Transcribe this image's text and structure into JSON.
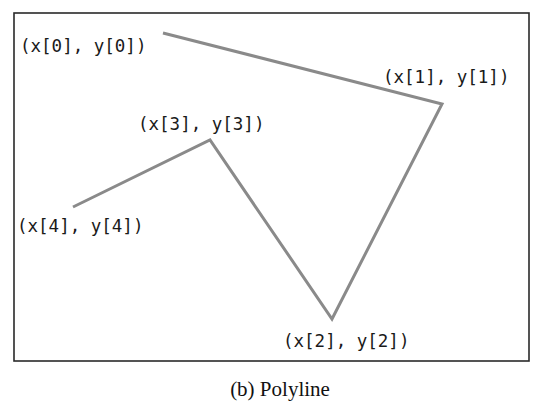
{
  "figure": {
    "caption": "(b) Polyline",
    "frame": {
      "x": 14,
      "y": 13,
      "width": 515,
      "height": 348,
      "stroke": "#2a2a2a"
    },
    "line_color": "#8a8a8a"
  },
  "vertices": [
    {
      "label": "(x[0], y[0])",
      "x": 163,
      "y": 33,
      "label_x": 20,
      "label_y": 47
    },
    {
      "label": "(x[1], y[1])",
      "x": 442,
      "y": 104,
      "label_x": 383,
      "label_y": 78
    },
    {
      "label": "(x[2], y[2])",
      "x": 332,
      "y": 319,
      "label_x": 283,
      "label_y": 342
    },
    {
      "label": "(x[3], y[3])",
      "x": 210,
      "y": 140,
      "label_x": 138,
      "label_y": 125
    },
    {
      "label": "(x[4], y[4])",
      "x": 73,
      "y": 207,
      "label_x": 17,
      "label_y": 227
    }
  ],
  "polyline_points": "163,33 442,104 332,319 210,140 73,207"
}
